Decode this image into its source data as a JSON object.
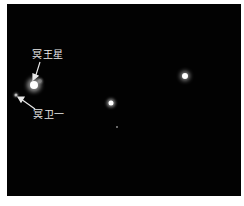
{
  "image": {
    "background": "#020202",
    "frame_color": "#ffffff"
  },
  "labels": {
    "pluto": "冥王星",
    "charon": "冥卫一"
  },
  "objects": [
    {
      "name": "pluto",
      "x": 27,
      "y": 81,
      "size": 9,
      "glow": 8
    },
    {
      "name": "charon",
      "x": 9,
      "y": 91,
      "size": 3,
      "glow": 3
    },
    {
      "name": "pluto-companion-glow",
      "x": 32,
      "y": 77,
      "size": 4,
      "glow": 3
    },
    {
      "name": "star-right",
      "x": 178,
      "y": 71,
      "size": 7,
      "glow": 7
    },
    {
      "name": "star-center",
      "x": 104,
      "y": 98,
      "size": 6,
      "glow": 6
    },
    {
      "name": "star-faint",
      "x": 109,
      "y": 122,
      "size": 2,
      "glow": 2
    }
  ]
}
